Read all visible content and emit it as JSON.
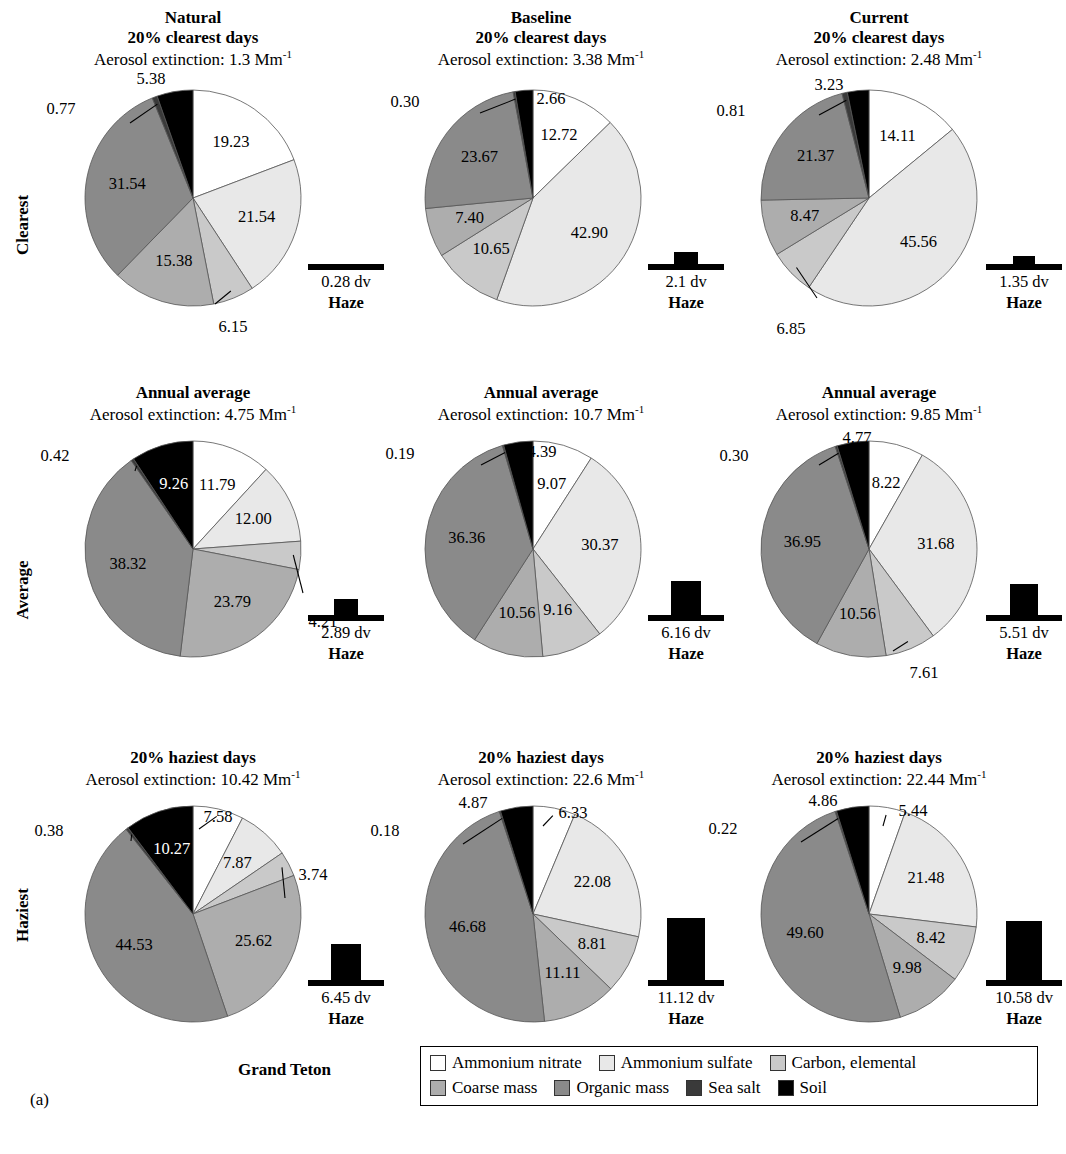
{
  "figure": {
    "site": "Grand Teton",
    "tag": "(a)",
    "row_labels": [
      "Clearest",
      "Average",
      "Haziest"
    ],
    "column_labels": [
      "Natural",
      "Baseline",
      "Current"
    ],
    "haze_word": "Haze",
    "extinction_prefix": "Aerosol extinction: ",
    "extinction_unit": "Mm",
    "extinction_exp": "-1",
    "dv_unit": "dv"
  },
  "legend": {
    "rows": [
      [
        {
          "label": "Ammonium nitrate",
          "color": "#ffffff"
        },
        {
          "label": "Ammonium sulfate",
          "color": "#e8e8e8"
        },
        {
          "label": "Carbon, elemental",
          "color": "#c9c9c9"
        }
      ],
      [
        {
          "label": "Coarse mass",
          "color": "#adadad"
        },
        {
          "label": "Organic mass",
          "color": "#8a8a8a"
        },
        {
          "label": "Sea salt",
          "color": "#3a3a3a"
        },
        {
          "label": "Soil",
          "color": "#000000"
        }
      ]
    ]
  },
  "chart_data": {
    "type": "pie",
    "categories": [
      "Ammonium nitrate",
      "Ammonium sulfate",
      "Carbon, elemental",
      "Coarse mass",
      "Organic mass",
      "Sea salt",
      "Soil"
    ],
    "colors": [
      "#ffffff",
      "#e8e8e8",
      "#c9c9c9",
      "#adadad",
      "#8a8a8a",
      "#3a3a3a",
      "#000000"
    ],
    "units": {
      "values": "percent",
      "extinction": "Mm^-1",
      "haze": "dv"
    },
    "panels": [
      {
        "row": "Clearest",
        "column": "Natural",
        "scenario": "Natural",
        "days": "20% clearest days",
        "extinction": "1.3",
        "values": [
          19.23,
          21.54,
          6.15,
          15.38,
          31.54,
          0.77,
          5.38
        ],
        "haze": "0.28"
      },
      {
        "row": "Clearest",
        "column": "Baseline",
        "scenario": "Baseline",
        "days": "20% clearest days",
        "extinction": "3.38",
        "values": [
          12.72,
          42.9,
          10.65,
          7.4,
          23.67,
          0.3,
          2.66
        ],
        "haze": "2.1"
      },
      {
        "row": "Clearest",
        "column": "Current",
        "scenario": "Current",
        "days": "20% clearest days",
        "extinction": "2.48",
        "values": [
          14.11,
          45.56,
          6.85,
          8.47,
          21.37,
          0.81,
          3.23
        ],
        "haze": "1.35"
      },
      {
        "row": "Average",
        "column": "Natural",
        "scenario": "",
        "days": "Annual average",
        "extinction": "4.75",
        "values": [
          11.79,
          12.0,
          4.21,
          23.79,
          38.32,
          0.42,
          9.26
        ],
        "haze": "2.89"
      },
      {
        "row": "Average",
        "column": "Baseline",
        "scenario": "",
        "days": "Annual average",
        "extinction": "10.7",
        "values": [
          9.07,
          30.37,
          9.16,
          10.56,
          36.36,
          0.19,
          4.39
        ],
        "haze": "6.16"
      },
      {
        "row": "Average",
        "column": "Current",
        "scenario": "",
        "days": "Annual average",
        "extinction": "9.85",
        "values": [
          8.22,
          31.68,
          7.61,
          10.56,
          36.95,
          0.3,
          4.77
        ],
        "haze": "5.51"
      },
      {
        "row": "Haziest",
        "column": "Natural",
        "scenario": "",
        "days": "20% haziest days",
        "extinction": "10.42",
        "values": [
          7.58,
          7.87,
          3.74,
          25.62,
          44.53,
          0.38,
          10.27
        ],
        "haze": "6.45"
      },
      {
        "row": "Haziest",
        "column": "Baseline",
        "scenario": "",
        "days": "20% haziest days",
        "extinction": "22.6",
        "values": [
          6.33,
          22.08,
          8.81,
          11.11,
          46.68,
          0.18,
          4.87
        ],
        "haze": "11.12"
      },
      {
        "row": "Haziest",
        "column": "Current",
        "scenario": "",
        "days": "20% haziest days",
        "extinction": "22.44",
        "values": [
          5.44,
          21.48,
          8.42,
          9.98,
          49.6,
          0.22,
          4.86
        ],
        "haze": "10.58"
      }
    ]
  }
}
